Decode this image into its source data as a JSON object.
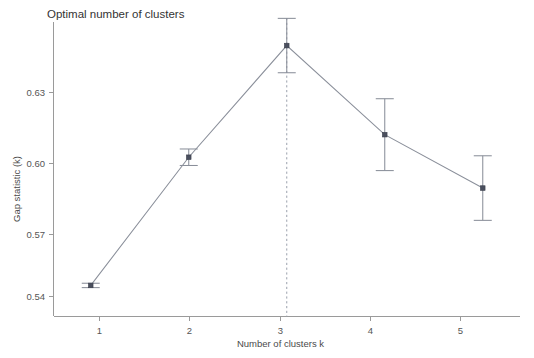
{
  "chart_data": {
    "type": "line",
    "title": "Optimal number of clusters",
    "xlabel": "Number of clusters k",
    "ylabel": "Gap statistic (k)",
    "x": [
      1,
      2,
      3,
      4,
      5
    ],
    "xticklabels": [
      "1",
      "2",
      "3",
      "4",
      "5"
    ],
    "yticks": [
      0.54,
      0.57,
      0.6,
      0.63
    ],
    "yticklabels": [
      "0.54",
      "0.57",
      "0.60",
      "0.63"
    ],
    "xlim": [
      0.62,
      5.38
    ],
    "ylim": [
      0.5285,
      0.6498
    ],
    "values": [
      0.5413,
      0.5941,
      0.6401,
      0.6034,
      0.5814
    ],
    "errors": [
      0.0009,
      0.0034,
      0.0112,
      0.0148,
      0.0133
    ],
    "series": [
      {
        "name": "Gap statistic (k)",
        "values": [
          0.5413,
          0.5941,
          0.6401,
          0.6034,
          0.5814
        ],
        "errors": [
          0.0009,
          0.0034,
          0.0112,
          0.0148,
          0.0133
        ]
      }
    ],
    "annotations": [
      {
        "type": "vline",
        "x": 3,
        "style": "dashed",
        "label": "optimal k = 3"
      }
    ],
    "grid": false,
    "legend": "none",
    "marker": "square",
    "errorbar_style": "capped",
    "colors": {
      "line": "#8a8f9a",
      "marker": "#4a4f5e",
      "errorbar": "#8a8f9a",
      "vline": "#9aa0ac",
      "axis": "#9a9a9a",
      "text": "#555555",
      "background": "#ffffff"
    }
  },
  "axes": {
    "y_tick_0": "0.54",
    "y_tick_1": "0.57",
    "y_tick_2": "0.60",
    "y_tick_3": "0.63",
    "x_tick_0": "1",
    "x_tick_1": "2",
    "x_tick_2": "3",
    "x_tick_3": "4",
    "x_tick_4": "5"
  }
}
